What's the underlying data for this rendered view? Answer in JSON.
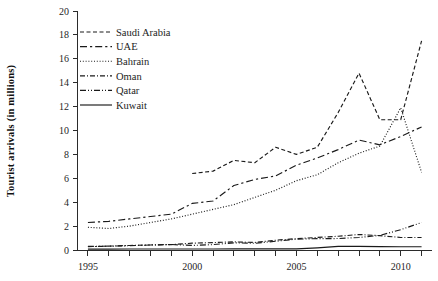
{
  "chart_data": {
    "type": "line",
    "title": "",
    "xlabel": "",
    "ylabel": "Tourist arrivals (in millions)",
    "xlim": [
      1994.5,
      2011.5
    ],
    "ylim": [
      0,
      20
    ],
    "grid": false,
    "legend_position": "top-left",
    "x_tick_labels": [
      "1995",
      "2000",
      "2005",
      "2010"
    ],
    "x_tick_values": [
      1995,
      2000,
      2005,
      2010
    ],
    "x_minor_ticks": [
      1995,
      1996,
      1997,
      1998,
      1999,
      2000,
      2001,
      2002,
      2003,
      2004,
      2005,
      2006,
      2007,
      2008,
      2009,
      2010,
      2011
    ],
    "y_tick_labels": [
      "0",
      "2",
      "4",
      "6",
      "8",
      "10",
      "12",
      "14",
      "16",
      "18",
      "20"
    ],
    "y_tick_values": [
      0,
      2,
      4,
      6,
      8,
      10,
      12,
      14,
      16,
      18,
      20
    ],
    "series": [
      {
        "name": "Saudi Arabia",
        "dash_style": "dashed",
        "dash_array": "4,2.5",
        "x": [
          2000,
          2001,
          2002,
          2003,
          2004,
          2005,
          2006,
          2007,
          2008,
          2009,
          2010,
          2011
        ],
        "values": [
          6.4,
          6.6,
          7.5,
          7.3,
          8.6,
          8.0,
          8.6,
          11.5,
          14.8,
          10.9,
          10.9,
          17.5
        ]
      },
      {
        "name": "UAE",
        "dash_style": "long-dash",
        "dash_array": "7,3,2.2,3",
        "x": [
          1995,
          1996,
          1997,
          1998,
          1999,
          2000,
          2001,
          2002,
          2003,
          2004,
          2005,
          2006,
          2007,
          2008,
          2009,
          2010,
          2011
        ],
        "values": [
          2.3,
          2.4,
          2.6,
          2.8,
          3.0,
          3.9,
          4.1,
          5.4,
          5.9,
          6.2,
          7.1,
          7.7,
          8.4,
          9.2,
          8.8,
          9.5,
          10.3
        ]
      },
      {
        "name": "Bahrain",
        "dash_style": "dotted",
        "dash_array": "1,1.8",
        "x": [
          1995,
          1996,
          1997,
          1998,
          1999,
          2000,
          2001,
          2002,
          2003,
          2004,
          2005,
          2006,
          2007,
          2008,
          2009,
          2010,
          2011
        ],
        "values": [
          1.9,
          1.8,
          2.0,
          2.3,
          2.6,
          3.0,
          3.4,
          3.8,
          4.4,
          5.0,
          5.8,
          6.3,
          7.3,
          8.1,
          8.7,
          11.9,
          6.5
        ]
      },
      {
        "name": "Oman",
        "dash_style": "dash-dot",
        "dash_array": "5,2,1,2",
        "x": [
          1995,
          1996,
          1997,
          1998,
          1999,
          2000,
          2001,
          2002,
          2003,
          2004,
          2005,
          2006,
          2007,
          2008,
          2009,
          2010,
          2011
        ],
        "values": [
          0.28,
          0.32,
          0.38,
          0.42,
          0.45,
          0.57,
          0.62,
          0.68,
          0.63,
          0.82,
          0.95,
          1.05,
          1.15,
          1.3,
          1.2,
          1.05,
          1.05
        ]
      },
      {
        "name": "Qatar",
        "dash_style": "dash-dot-dot",
        "dash_array": "6,2,1,2,1,2",
        "x": [
          1995,
          1996,
          1997,
          1998,
          1999,
          2000,
          2001,
          2002,
          2003,
          2004,
          2005,
          2006,
          2007,
          2008,
          2009,
          2010,
          2011
        ],
        "values": [
          0.3,
          0.32,
          0.36,
          0.42,
          0.46,
          0.38,
          0.45,
          0.6,
          0.56,
          0.73,
          0.91,
          0.95,
          0.96,
          1.05,
          1.22,
          1.7,
          2.3
        ]
      },
      {
        "name": "Kuwait",
        "dash_style": "solid",
        "dash_array": "",
        "x": [
          1995,
          1996,
          1997,
          1998,
          1999,
          2000,
          2001,
          2002,
          2003,
          2004,
          2005,
          2006,
          2007,
          2008,
          2009,
          2010,
          2011
        ],
        "values": [
          0.07,
          0.07,
          0.08,
          0.08,
          0.08,
          0.08,
          0.08,
          0.09,
          0.09,
          0.09,
          0.09,
          0.18,
          0.3,
          0.3,
          0.28,
          0.27,
          0.27
        ]
      }
    ]
  },
  "legend": {
    "items": [
      {
        "label": "Saudi Arabia"
      },
      {
        "label": "UAE"
      },
      {
        "label": "Bahrain"
      },
      {
        "label": "Oman"
      },
      {
        "label": "Qatar"
      },
      {
        "label": "Kuwait"
      }
    ]
  },
  "colors": {
    "ink": "#1a1a1a",
    "axis": "#2b2b2b",
    "background": "#ffffff"
  }
}
